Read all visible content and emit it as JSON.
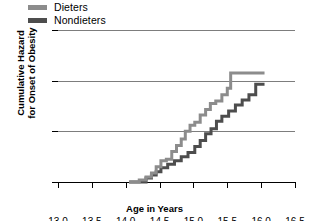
{
  "chart_data": {
    "type": "line",
    "subtype": "step",
    "title": "",
    "xlabel": "Age in Years",
    "ylabel": "Cumulative Hazard for Onset of Obesity",
    "ylabel_line1": "Cumulative Hazard",
    "ylabel_line2": "for Onset of Obesity",
    "xlim": [
      13.0,
      16.5
    ],
    "ylim": [
      0.0,
      0.3
    ],
    "xticks": [
      13.0,
      13.5,
      14.0,
      14.5,
      15.0,
      15.5,
      16.0,
      16.5
    ],
    "xtick_labels": [
      "13.0",
      "13.5",
      "14.0",
      "14.5",
      "15.0",
      "15.5",
      "16.0",
      "16.5"
    ],
    "yticks": [
      0.0,
      0.1,
      0.2,
      0.3
    ],
    "ytick_labels": [
      "0.00",
      "0.10",
      "0.20",
      "0.30"
    ],
    "grid": "horizontal",
    "gridlines_y": [
      0.1,
      0.2,
      0.3
    ],
    "legend_position": "top-left",
    "series": [
      {
        "name": "Dieters",
        "color": "#8c8c8c",
        "x": [
          14.05,
          14.2,
          14.3,
          14.38,
          14.45,
          14.52,
          14.6,
          14.68,
          14.75,
          14.82,
          14.88,
          14.95,
          15.02,
          15.1,
          15.18,
          15.25,
          15.33,
          15.42,
          15.5,
          15.55,
          16.05
        ],
        "y": [
          0.0,
          0.004,
          0.01,
          0.018,
          0.03,
          0.042,
          0.045,
          0.06,
          0.072,
          0.085,
          0.1,
          0.112,
          0.118,
          0.132,
          0.143,
          0.155,
          0.16,
          0.172,
          0.185,
          0.215,
          0.215
        ]
      },
      {
        "name": "Nondieters",
        "color": "#4d4d4d",
        "x": [
          14.05,
          14.22,
          14.3,
          14.38,
          14.45,
          14.52,
          14.62,
          14.72,
          14.82,
          14.92,
          15.02,
          15.1,
          15.18,
          15.26,
          15.34,
          15.42,
          15.52,
          15.62,
          15.72,
          15.82,
          15.92,
          16.05
        ],
        "y": [
          0.0,
          0.0,
          0.008,
          0.014,
          0.02,
          0.028,
          0.035,
          0.042,
          0.05,
          0.058,
          0.07,
          0.082,
          0.095,
          0.105,
          0.12,
          0.13,
          0.14,
          0.152,
          0.162,
          0.172,
          0.193,
          0.193
        ]
      }
    ]
  },
  "legend": {
    "items": [
      {
        "label": "Dieters",
        "color": "#8c8c8c"
      },
      {
        "label": "Nondieters",
        "color": "#4d4d4d"
      }
    ]
  },
  "axes": {
    "x_title": "Age in Years",
    "y_title_line1": "Cumulative Hazard",
    "y_title_line2": "for Onset of Obesity"
  },
  "colors": {
    "dieters": "#8c8c8c",
    "nondieters": "#4d4d4d",
    "gridline": "#7d7d7d",
    "axis": "#000000",
    "background": "#ffffff"
  }
}
